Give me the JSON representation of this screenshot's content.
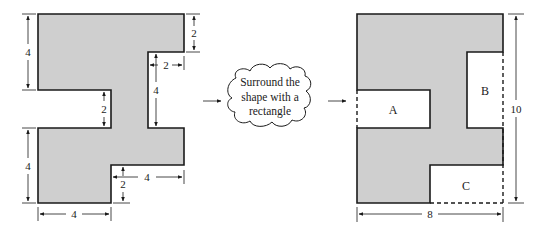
{
  "colors": {
    "shape_fill": "#cfcfcf",
    "stroke": "#1a1a1a",
    "background": "#ffffff"
  },
  "left_figure": {
    "dimensions": {
      "top_left_height": "4",
      "top_right_notch_height": "2",
      "right_notch_width": "2",
      "right_notch_height": "4",
      "left_notch_height": "2",
      "bottom_left_height": "4",
      "bottom_right_notch_width": "4",
      "bottom_right_notch_height": "2",
      "bottom_width": "4"
    }
  },
  "cloud": {
    "lines": [
      "Surround the",
      "shape with a",
      "rectangle"
    ]
  },
  "right_figure": {
    "regions": {
      "a": "A",
      "b": "B",
      "c": "C"
    },
    "dimensions": {
      "height": "10",
      "width": "8"
    }
  }
}
